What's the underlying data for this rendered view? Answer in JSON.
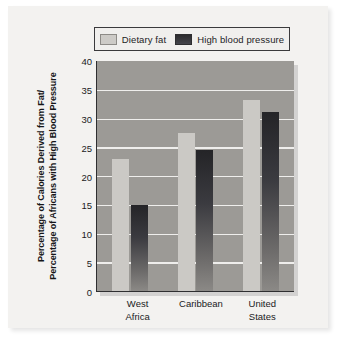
{
  "chart_data": {
    "type": "bar",
    "title": "",
    "subtitle": "",
    "xlabel": "",
    "ylabel": "Percentage of Calories Derived from Fat/ Percentage of Africans with High Blood Pressure",
    "ylabel_lines": [
      "Percentage of Calories Derived from Fat/",
      "Percentage of Africans with High Blood Pressure"
    ],
    "categories": [
      "West Africa",
      "Caribbean",
      "United States"
    ],
    "category_lines": [
      [
        "West",
        "Africa"
      ],
      [
        "Caribbean",
        ""
      ],
      [
        "United",
        "States"
      ]
    ],
    "series": [
      {
        "name": "Dietary fat",
        "values": [
          23.0,
          27.5,
          33.2
        ],
        "color": "#cbc9c5"
      },
      {
        "name": "High blood pressure",
        "values": [
          15.0,
          24.5,
          31.2
        ],
        "color": "#2c2c2e"
      }
    ],
    "ylim": [
      0,
      40
    ],
    "yticks": [
      0,
      5,
      10,
      15,
      20,
      25,
      30,
      35,
      40
    ],
    "ytick_labels": [
      "0",
      "5",
      "10",
      "15",
      "20",
      "25",
      "30",
      "35",
      "40"
    ],
    "grid": true,
    "grid_color": "#efeeec",
    "legend_position": "top",
    "plot_background": "#9c9a96",
    "figure_background": "#f3f2f0"
  },
  "legend": {
    "entries": [
      {
        "label": "Dietary fat",
        "swatch": "light-gray-swatch"
      },
      {
        "label": "High blood pressure",
        "swatch": "dark-gray-swatch"
      }
    ]
  },
  "caption": {
    "partial_text": ""
  }
}
